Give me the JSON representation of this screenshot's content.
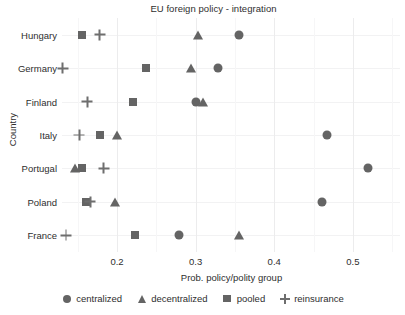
{
  "chart_data": {
    "type": "scatter",
    "title": "EU foreign policy - integration",
    "xlabel": "Prob. policy/polity group",
    "ylabel": "Country",
    "grid": true,
    "legend_position": "bottom",
    "xlim": [
      0.13,
      0.56
    ],
    "xticks": [
      0.2,
      0.3,
      0.4,
      0.5
    ],
    "xtick_labels": [
      "0.2",
      "0.3",
      "0.4",
      "0.5"
    ],
    "xminor_ticks": [
      0.15,
      0.25,
      0.35,
      0.45,
      0.55
    ],
    "categories": [
      "Hungary",
      "Germany",
      "Finland",
      "Italy",
      "Portugal",
      "Poland",
      "France"
    ],
    "series": [
      {
        "name": "centralized",
        "marker": "circle",
        "color": "#646464",
        "values": [
          0.355,
          0.328,
          0.3,
          0.467,
          0.519,
          0.461,
          0.279
        ]
      },
      {
        "name": "decentralized",
        "marker": "triangle",
        "color": "#646464",
        "values": [
          0.303,
          0.294,
          0.309,
          0.2,
          0.146,
          0.198,
          0.355
        ]
      },
      {
        "name": "pooled",
        "marker": "square",
        "color": "#646464",
        "values": [
          0.155,
          0.237,
          0.22,
          0.178,
          0.155,
          0.161,
          0.223
        ]
      },
      {
        "name": "reinsurance",
        "marker": "plus",
        "color": "#6e6e6e",
        "values": [
          0.178,
          0.131,
          0.162,
          0.152,
          0.183,
          0.166,
          0.135
        ]
      }
    ]
  },
  "legend": {
    "items": [
      {
        "label": "centralized",
        "marker": "circle"
      },
      {
        "label": "decentralized",
        "marker": "triangle"
      },
      {
        "label": "pooled",
        "marker": "square"
      },
      {
        "label": "reinsurance",
        "marker": "plus"
      }
    ]
  }
}
